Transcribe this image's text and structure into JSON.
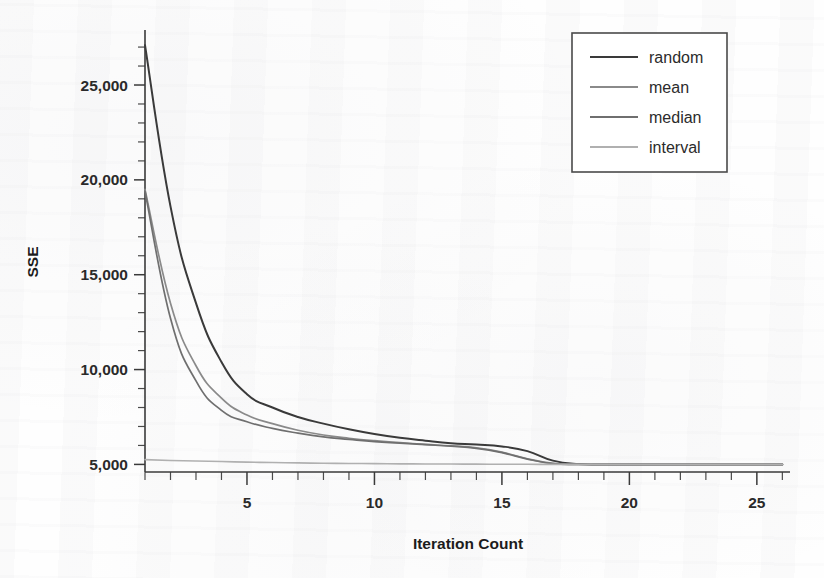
{
  "chart_data": {
    "type": "line",
    "title": "",
    "xlabel": "Iteration Count",
    "ylabel": "SSE",
    "xlim": [
      1,
      26.3
    ],
    "ylim": [
      4600,
      27900
    ],
    "grid": false,
    "legend_position": "top-right",
    "x_ticks": [
      5,
      10,
      15,
      20,
      25
    ],
    "x_tick_labels": [
      "5",
      "10",
      "15",
      "20",
      "25"
    ],
    "x_minor_tick_step": 1,
    "y_ticks": [
      5000,
      10000,
      15000,
      20000,
      25000
    ],
    "y_tick_labels": [
      "5,000",
      "10,000",
      "15,000",
      "20,000",
      "25,000"
    ],
    "y_minor_tick_step": 1000,
    "x": [
      1,
      2,
      3,
      4,
      5,
      6,
      7,
      8,
      9,
      10,
      11,
      12,
      13,
      14,
      15,
      16,
      17,
      18,
      19,
      20,
      21,
      22,
      23,
      24,
      25,
      26
    ],
    "series": [
      {
        "name": "random",
        "color": "#3a3a3a",
        "width": 2.0,
        "values": [
          27100,
          18600,
          13500,
          10400,
          8700,
          8000,
          7500,
          7150,
          6850,
          6600,
          6400,
          6250,
          6120,
          6050,
          5950,
          5700,
          5200,
          5020,
          5000,
          5000,
          5000,
          5000,
          5000,
          5000,
          5000,
          5000
        ]
      },
      {
        "name": "mean",
        "color": "#8a8a8a",
        "width": 1.7,
        "values": [
          19500,
          13500,
          10200,
          8500,
          7600,
          7150,
          6800,
          6550,
          6380,
          6250,
          6150,
          6060,
          5980,
          5880,
          5650,
          5300,
          5050,
          5000,
          5000,
          5000,
          5000,
          5000,
          5000,
          5000,
          5000,
          5000
        ]
      },
      {
        "name": "median",
        "color": "#6f6f6f",
        "width": 1.7,
        "values": [
          19400,
          12700,
          9400,
          7850,
          7250,
          6900,
          6650,
          6450,
          6320,
          6200,
          6120,
          6040,
          5960,
          5850,
          5620,
          5280,
          5040,
          5000,
          5000,
          5000,
          5000,
          5000,
          5000,
          5000,
          5000,
          5000
        ]
      },
      {
        "name": "interval",
        "color": "#b0b0b0",
        "width": 1.6,
        "values": [
          5250,
          5210,
          5180,
          5150,
          5120,
          5100,
          5080,
          5060,
          5050,
          5040,
          5030,
          5025,
          5020,
          5015,
          5010,
          5005,
          5000,
          5000,
          5000,
          5000,
          5000,
          5000,
          5000,
          5000,
          5000,
          5000
        ]
      }
    ],
    "legend_entries": [
      "random",
      "mean",
      "median",
      "interval"
    ]
  },
  "axes": {
    "y_title": "SSE",
    "x_title": "Iteration Count"
  }
}
